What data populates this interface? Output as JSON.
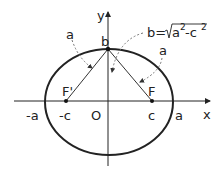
{
  "diagram": {
    "axes": {
      "x_label": "x",
      "y_label": "y",
      "origin_label": "O"
    },
    "points": {
      "left_vertex": "-a",
      "right_vertex": "a",
      "left_focus_coord": "-c",
      "right_focus_coord": "c",
      "left_focus": "F'",
      "right_focus": "F",
      "co_vertex": "b"
    },
    "annotations": {
      "left_segment": "a",
      "right_segment": "a",
      "b_formula_prefix": "b=",
      "b_formula_radicand_a": "a",
      "b_formula_exp1": "2",
      "b_formula_minus": "-c",
      "b_formula_exp2": "2"
    },
    "colors": {
      "stroke": "#222222",
      "dashed": "#777777"
    }
  }
}
